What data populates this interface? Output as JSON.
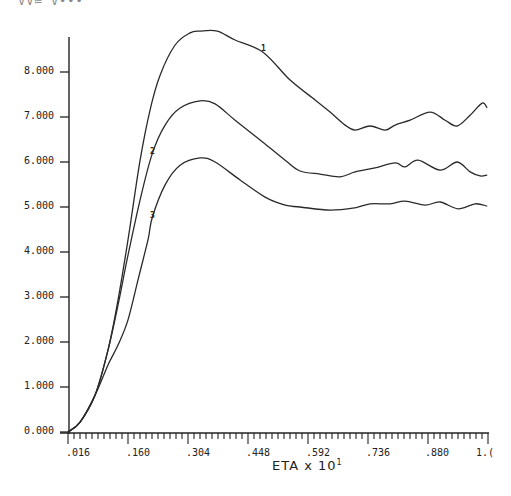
{
  "header": {
    "clipped_text": "VV≔ V•••"
  },
  "chart_data": {
    "type": "line",
    "title": "",
    "xlabel": "ETA x 10¹",
    "ylabel": "",
    "xlim": [
      0.016,
      1.024
    ],
    "ylim": [
      0.0,
      8.6
    ],
    "grid": false,
    "legend": "inline curve labels",
    "x_ticks": [
      ".016",
      ".160",
      ".304",
      ".448",
      ".592",
      ".736",
      ".880",
      "1.0"
    ],
    "y_ticks": [
      "0.000",
      "1.000",
      "2.000",
      "3.000",
      "4.000",
      "5.000",
      "6.000",
      "7.000",
      "8.000"
    ],
    "series": [
      {
        "name": "1",
        "x": [
          0.016,
          0.045,
          0.081,
          0.112,
          0.136,
          0.16,
          0.189,
          0.213,
          0.237,
          0.273,
          0.309,
          0.333,
          0.374,
          0.417,
          0.484,
          0.549,
          0.609,
          0.645,
          0.681,
          0.705,
          0.741,
          0.777,
          0.801,
          0.837,
          0.885,
          0.921,
          0.95,
          0.981,
          1.01,
          1.022
        ],
        "y": [
          0.0,
          0.22,
          0.82,
          1.82,
          2.93,
          4.27,
          6.04,
          7.16,
          7.93,
          8.6,
          8.87,
          8.91,
          8.91,
          8.71,
          8.44,
          7.82,
          7.38,
          7.11,
          6.82,
          6.71,
          6.8,
          6.71,
          6.82,
          6.93,
          7.11,
          6.93,
          6.8,
          7.04,
          7.31,
          7.2
        ]
      },
      {
        "name": "2",
        "x": [
          0.016,
          0.045,
          0.081,
          0.112,
          0.136,
          0.16,
          0.189,
          0.218,
          0.249,
          0.285,
          0.333,
          0.369,
          0.417,
          0.477,
          0.537,
          0.573,
          0.621,
          0.669,
          0.705,
          0.753,
          0.801,
          0.825,
          0.856,
          0.909,
          0.95,
          0.981,
          1.005,
          1.022
        ],
        "y": [
          0.0,
          0.22,
          0.82,
          1.82,
          2.82,
          3.93,
          5.16,
          6.18,
          6.82,
          7.2,
          7.36,
          7.29,
          6.93,
          6.49,
          6.04,
          5.8,
          5.73,
          5.67,
          5.78,
          5.87,
          5.98,
          5.89,
          6.04,
          5.82,
          6.0,
          5.78,
          5.69,
          5.71
        ]
      },
      {
        "name": "3",
        "x": [
          0.016,
          0.045,
          0.081,
          0.112,
          0.136,
          0.16,
          0.184,
          0.208,
          0.218,
          0.249,
          0.285,
          0.333,
          0.369,
          0.429,
          0.489,
          0.537,
          0.573,
          0.645,
          0.705,
          0.741,
          0.789,
          0.825,
          0.873,
          0.909,
          0.952,
          0.993,
          1.022
        ],
        "y": [
          0.0,
          0.22,
          0.82,
          1.49,
          1.93,
          2.49,
          3.38,
          4.27,
          4.76,
          5.49,
          5.93,
          6.09,
          6.0,
          5.6,
          5.22,
          5.04,
          5.0,
          4.93,
          4.98,
          5.07,
          5.07,
          5.13,
          5.04,
          5.11,
          4.96,
          5.07,
          5.02
        ]
      }
    ],
    "annotations": [
      {
        "text": "1",
        "x": 0.484,
        "y": 8.44
      },
      {
        "text": "2",
        "x": 0.218,
        "y": 6.18
      },
      {
        "text": "3",
        "x": 0.218,
        "y": 4.76
      }
    ]
  },
  "axes": {
    "x_tick_labels": [
      ".016",
      ".160",
      ".304",
      ".448",
      ".592",
      ".736",
      ".880",
      "1.("
    ],
    "y_tick_labels": [
      "0.000",
      "1.000",
      "2.000",
      "3.000",
      "4.000",
      "5.000",
      "6.000",
      "7.000",
      "8.000"
    ],
    "xlabel_text": "ETA x 10",
    "xlabel_exponent": "1"
  },
  "curve_labels": [
    "1",
    "2",
    "3"
  ],
  "colors": {
    "line": "#2a2a2a",
    "axis": "#222222",
    "background": "#ffffff"
  }
}
